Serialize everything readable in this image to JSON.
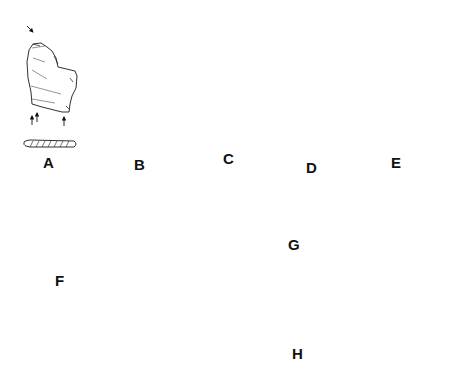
{
  "figure": {
    "type": "lithic artifact illustration plate",
    "background": "#ffffff",
    "ink_color": "#1a1a1a",
    "artifacts": [
      {
        "id": "A",
        "label": "A",
        "description": "burin on flake with cross-section",
        "arrows": 4
      },
      {
        "id": "B",
        "label": "B",
        "description": "burin with lateral retouch and cross-section",
        "arrows": 2
      },
      {
        "id": "C",
        "label": "C",
        "description": "burin with retouched edge and cross-section",
        "arrows": 2
      },
      {
        "id": "D",
        "label": "D",
        "description": "dihedral burin with cross-section",
        "arrows": 4
      },
      {
        "id": "E",
        "label": "E",
        "description": "small retouched point with cross-section",
        "arrows": 2
      },
      {
        "id": "F",
        "label": "F",
        "description": "four bladelets with cross-sections"
      },
      {
        "id": "G",
        "label": "G",
        "description": "core-like piece, three views"
      },
      {
        "id": "H",
        "label": "H",
        "description": "retouched piece, profile plus three views"
      }
    ]
  },
  "labels": {
    "A": "A",
    "B": "B",
    "C": "C",
    "D": "D",
    "E": "E",
    "F": "F",
    "G": "G",
    "H": "H"
  }
}
